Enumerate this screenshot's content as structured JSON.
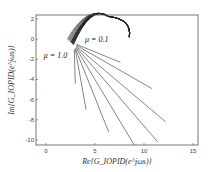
{
  "chart_data": {
    "type": "line",
    "title": "",
    "xlabel": "Re{G_IOPID(e^jωs)}",
    "ylabel": "Im{G_IOPID(e^jωs)}",
    "xlim": [
      -1,
      15.5
    ],
    "ylim": [
      -10.5,
      2.4
    ],
    "xticks": [
      0,
      5,
      10,
      15
    ],
    "yticks": [
      2,
      0,
      -2,
      -4,
      -6,
      -8,
      -10
    ],
    "grid": false,
    "annotations": [
      {
        "text": "μ = 0.1",
        "x": 4.0,
        "y": -0.3
      },
      {
        "text": "μ = 1.0",
        "x": -0.2,
        "y": -1.9
      }
    ],
    "arc": {
      "start": [
        2.2,
        0.0
      ],
      "peak": [
        5.8,
        2.3
      ],
      "end": [
        8.5,
        0.2
      ],
      "band_offsets": [
        0,
        0.15,
        0.3,
        0.45,
        0.6,
        0.75,
        0.9,
        1.05,
        1.2
      ]
    },
    "series": [
      {
        "name": "μ=0.1",
        "x": [
          3.1,
          7.6
        ],
        "y": [
          -0.5,
          -2.3
        ]
      },
      {
        "name": "μ=0.2",
        "x": [
          3.1,
          10.8
        ],
        "y": [
          -0.6,
          -4.9
        ]
      },
      {
        "name": "μ=0.3",
        "x": [
          3.1,
          12.2
        ],
        "y": [
          -0.7,
          -8.2
        ]
      },
      {
        "name": "μ=0.4",
        "x": [
          3.1,
          11.4
        ],
        "y": [
          -0.8,
          -10.2
        ]
      },
      {
        "name": "μ=0.5",
        "x": [
          3.1,
          9.0
        ],
        "y": [
          -0.9,
          -10.5
        ]
      },
      {
        "name": "μ=0.6",
        "x": [
          3.0,
          6.4
        ],
        "y": [
          -0.9,
          -9.2
        ]
      },
      {
        "name": "μ=0.7",
        "x": [
          3.0,
          4.1
        ],
        "y": [
          -1.0,
          -7.0
        ]
      },
      {
        "name": "μ=0.8",
        "x": [
          2.9,
          3.0
        ],
        "y": [
          -1.0,
          -4.4
        ]
      }
    ]
  }
}
